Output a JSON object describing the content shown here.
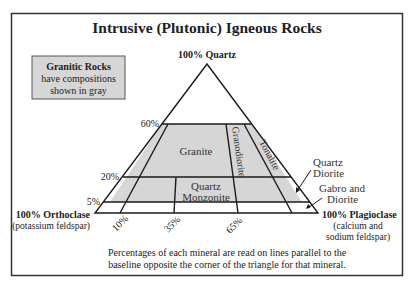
{
  "title": "Intrusive (Plutonic) Igneous Rocks",
  "legend_box": {
    "line1": "Granitic Rocks",
    "line2": "have compositions",
    "line3": "shown in gray",
    "fill": "#d6d6d6"
  },
  "vertices": {
    "top": "100% Quartz",
    "left": "100% Orthoclase",
    "left_sub": "(potassium feldspar)",
    "right": "100% Plagioclase",
    "right_sub1": "(calcium and",
    "right_sub2": "sodium feldspar)"
  },
  "quartz_levels": [
    "60%",
    "20%",
    "5%"
  ],
  "plagioclase_ticks": [
    "10%",
    "35%",
    "65%"
  ],
  "regions": {
    "granite": "Granite",
    "granodiorite": "Granodiorite",
    "tonalite": "Tonalite",
    "quartz_monzonite_1": "Quartz",
    "quartz_monzonite_2": "Monzonite"
  },
  "callouts": {
    "quartz_diorite_1": "Quartz",
    "quartz_diorite_2": "Diorite",
    "gabbro_1": "Gabro and",
    "gabbro_2": "Diorite"
  },
  "caption": {
    "line1": "Percentages of each mineral are read on lines parallel to the",
    "line2": "baseline opposite the corner of the triangle for that mineral."
  },
  "colors": {
    "gray_fill": "#d6d6d6",
    "line": "#1a1a1a",
    "frame": "#333333"
  }
}
